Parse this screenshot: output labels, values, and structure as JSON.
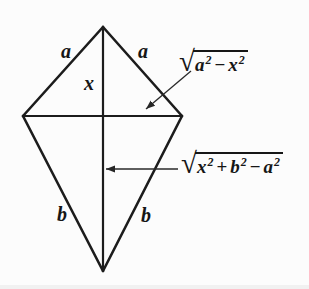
{
  "figure": {
    "kind": "kite-with-diagonals",
    "colors": {
      "background": "#fcfcfc",
      "ink": "#1b1b1b",
      "arrow": "#2a2a2a"
    },
    "side_labels": {
      "top_left": "a",
      "top_right": "a",
      "bottom_left": "b",
      "bottom_right": "b"
    },
    "segment_labels": {
      "upper_vertical_half": "x"
    },
    "annotations": {
      "half_horizontal": {
        "radical": "√",
        "terms": [
          {
            "v": "a",
            "p": "2"
          },
          {
            "op": "−"
          },
          {
            "v": "x",
            "p": "2"
          }
        ]
      },
      "lower_vertical": {
        "radical": "√",
        "terms": [
          {
            "v": "x",
            "p": "2"
          },
          {
            "op": "+"
          },
          {
            "v": "b",
            "p": "2"
          },
          {
            "op": "−"
          },
          {
            "v": "a",
            "p": "2"
          }
        ]
      }
    }
  }
}
